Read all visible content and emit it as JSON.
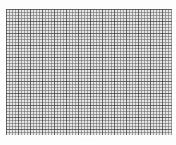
{
  "document": {
    "type": "graph-paper",
    "grid": {
      "minor_spacing_px": 3,
      "major_spacing_px": 12,
      "line_color": "#6e6e6e",
      "background_color": "#e6e6e6"
    },
    "caption": "· · ·"
  }
}
